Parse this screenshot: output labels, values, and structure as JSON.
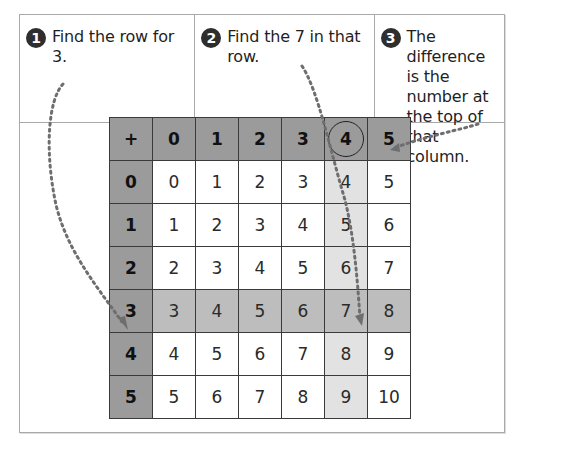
{
  "steps": [
    {
      "number": "1",
      "text": "Find the row for 3."
    },
    {
      "number": "2",
      "text": "Find the 7 in that row."
    },
    {
      "number": "3",
      "text": "The difference is the number at the top of that column."
    }
  ],
  "table": {
    "corner": "+",
    "column_headers": [
      "0",
      "1",
      "2",
      "3",
      "4",
      "5"
    ],
    "row_headers": [
      "0",
      "1",
      "2",
      "3",
      "4",
      "5"
    ],
    "rows": [
      [
        "0",
        "1",
        "2",
        "3",
        "4",
        "5"
      ],
      [
        "1",
        "2",
        "3",
        "4",
        "5",
        "6"
      ],
      [
        "2",
        "3",
        "4",
        "5",
        "6",
        "7"
      ],
      [
        "3",
        "4",
        "5",
        "6",
        "7",
        "8"
      ],
      [
        "4",
        "5",
        "6",
        "7",
        "8",
        "9"
      ],
      [
        "5",
        "6",
        "7",
        "8",
        "9",
        "10"
      ]
    ],
    "highlighted_row": "3",
    "highlighted_column": "4",
    "circled_header": "4",
    "target_value": "7"
  },
  "colors": {
    "header_fill": "#9b9b9b",
    "row_highlight": "#bdbdbd",
    "column_highlight": "#e2e2e2",
    "arrow": "#6e6e6e"
  }
}
